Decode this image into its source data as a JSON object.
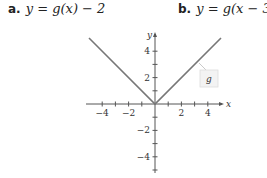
{
  "problems": [
    {
      "label": "a.",
      "equation": "y = g(x) − 2"
    },
    {
      "label": "b.",
      "equation": "y = g(x − 3)"
    }
  ],
  "chart_data": {
    "type": "line",
    "title": "",
    "function_label": "g",
    "xlabel": "x",
    "ylabel": "y",
    "xlim": [
      -5,
      5
    ],
    "ylim": [
      -5,
      5
    ],
    "x_ticks": [
      -4,
      -3,
      -2,
      -1,
      1,
      2,
      3,
      4
    ],
    "x_tick_labels": [
      "-4",
      "-2",
      "2",
      "4"
    ],
    "y_ticks": [
      -5,
      -4,
      -3,
      -2,
      -1,
      1,
      2,
      3,
      4
    ],
    "y_tick_labels": [
      "4",
      "2",
      "-2",
      "-4"
    ],
    "series": [
      {
        "name": "g",
        "x": [
          -5,
          0,
          5
        ],
        "y": [
          5,
          0,
          5
        ]
      }
    ],
    "grid": false,
    "line_color": "#777777"
  }
}
